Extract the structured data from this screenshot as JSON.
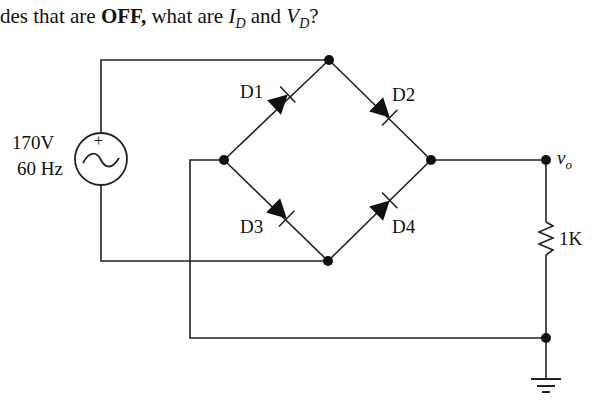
{
  "question": {
    "prefix": "des that are ",
    "bold": "OFF,",
    "middle": " what are ",
    "var1": "I",
    "var1_sub": "D",
    "and": " and ",
    "var2": "V",
    "var2_sub": "D",
    "suffix": "?"
  },
  "source": {
    "voltage": "170V",
    "frequency": "60 Hz",
    "polarity": "+"
  },
  "diodes": [
    {
      "id": "D1",
      "label": "D1"
    },
    {
      "id": "D2",
      "label": "D2"
    },
    {
      "id": "D3",
      "label": "D3"
    },
    {
      "id": "D4",
      "label": "D4"
    }
  ],
  "output": {
    "label": "v",
    "sub": "o"
  },
  "resistor": {
    "label": "1K"
  },
  "colors": {
    "ink": "#111111",
    "background": "#ffffff"
  }
}
